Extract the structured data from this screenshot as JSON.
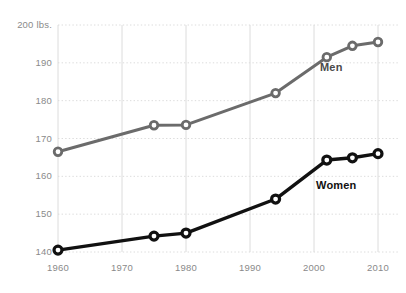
{
  "chart_data": {
    "type": "line",
    "title": "",
    "subtitle": "",
    "xlabel": "",
    "ylabel": "",
    "y_unit_label": "200 lbs.",
    "x": [
      1960,
      1975,
      1980,
      1994,
      2002,
      2006,
      2010
    ],
    "xlim": [
      1960,
      2010
    ],
    "ylim": [
      140,
      200
    ],
    "grid": true,
    "legend_position": "inline-annotation",
    "yticks": [
      140,
      150,
      160,
      170,
      180,
      190,
      200
    ],
    "ytick_labels": [
      "140",
      "150",
      "160",
      "170",
      "180",
      "190",
      "200 lbs."
    ],
    "xticks": [
      1960,
      1970,
      1980,
      1990,
      2000,
      2010
    ],
    "xtick_labels": [
      "1960",
      "1970",
      "1980",
      "1990",
      "2000",
      "2010"
    ],
    "series": [
      {
        "name": "Men",
        "color": "#6b6b6b",
        "marker": "open-circle",
        "values": [
          166.5,
          173.5,
          173.6,
          182.0,
          191.5,
          194.5,
          195.5
        ],
        "label_text": "Men",
        "label_color": "#4a4a4a"
      },
      {
        "name": "Women",
        "color": "#111111",
        "marker": "open-circle",
        "values": [
          140.5,
          144.2,
          145.0,
          154.0,
          164.3,
          164.9,
          166.0
        ],
        "label_text": "Women",
        "label_color": "#111111"
      }
    ]
  },
  "axis": {
    "grid_color": "#dcdcdc",
    "tick_text_color": "#8a8a8a"
  }
}
